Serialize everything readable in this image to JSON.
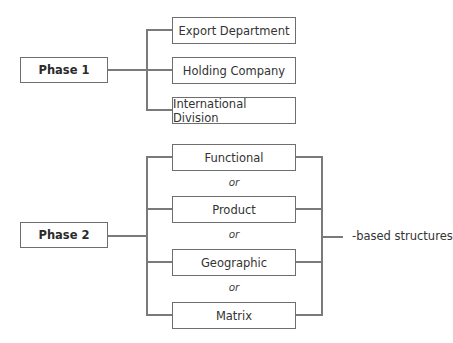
{
  "diagram": {
    "phase1": {
      "label": "Phase 1",
      "options": [
        "Export Department",
        "Holding Company",
        "International Division"
      ]
    },
    "phase2": {
      "label": "Phase 2",
      "options": [
        "Functional",
        "Product",
        "Geographic",
        "Matrix"
      ],
      "separator": "or",
      "suffix_label": "-based structures"
    },
    "colors": {
      "line": "#7a7a7a",
      "border": "#6e6e6e",
      "text": "#333333",
      "background": "#ffffff"
    }
  }
}
